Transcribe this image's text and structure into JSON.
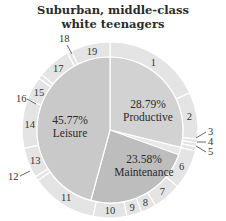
{
  "chart_data": {
    "type": "pie",
    "title_lines": [
      "Suburban, middle-class",
      "white teenagers"
    ],
    "inner": [
      {
        "name": "Productive",
        "percent": 28.79,
        "label": "28.79%",
        "color": "#d2d2d2"
      },
      {
        "name": "Maintenance",
        "percent": 23.58,
        "label": "23.58%",
        "color": "#bdbdbd"
      },
      {
        "name": "Leisure",
        "percent": 45.77,
        "label": "45.77%",
        "color": "#c9c9c9"
      }
    ],
    "inner_gap_percent": 1.86,
    "outer_color": "#e4e4e4",
    "outer": [
      {
        "label": "1",
        "start_deg": 0,
        "end_deg": 65
      },
      {
        "label": "2",
        "start_deg": 65,
        "end_deg": 96
      },
      {
        "label": "3",
        "start_deg": 96,
        "end_deg": 98.5,
        "callout": true
      },
      {
        "label": "4",
        "start_deg": 98.5,
        "end_deg": 101,
        "callout": true
      },
      {
        "label": "5",
        "start_deg": 101,
        "end_deg": 104,
        "callout": true
      },
      {
        "label": "6",
        "start_deg": 104,
        "end_deg": 130
      },
      {
        "label": "7",
        "start_deg": 130,
        "end_deg": 149
      },
      {
        "label": "8",
        "start_deg": 149,
        "end_deg": 159
      },
      {
        "label": "9",
        "start_deg": 159,
        "end_deg": 169
      },
      {
        "label": "10",
        "start_deg": 169,
        "end_deg": 191
      },
      {
        "label": "11",
        "start_deg": 191,
        "end_deg": 235
      },
      {
        "label": "12",
        "start_deg": 235,
        "end_deg": 238,
        "callout": true
      },
      {
        "label": "13",
        "start_deg": 238,
        "end_deg": 258
      },
      {
        "label": "14",
        "start_deg": 258,
        "end_deg": 290
      },
      {
        "label": "15",
        "start_deg": 290,
        "end_deg": 306
      },
      {
        "label": "16",
        "start_deg": 306,
        "end_deg": 309,
        "callout": true
      },
      {
        "label": "17",
        "start_deg": 309,
        "end_deg": 331
      },
      {
        "label": "18",
        "start_deg": 331,
        "end_deg": 334,
        "callout": true
      },
      {
        "label": "19",
        "start_deg": 334,
        "end_deg": 360
      }
    ],
    "legend": "none"
  }
}
